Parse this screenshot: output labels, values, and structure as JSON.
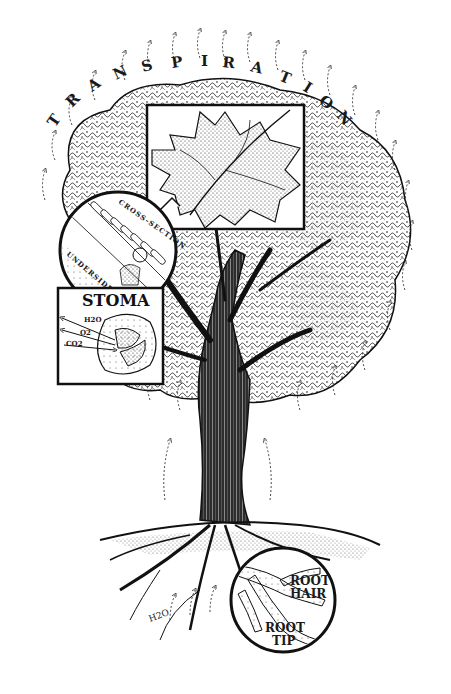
{
  "title_letters": [
    "T",
    "R",
    "A",
    "N",
    "S",
    "P",
    "I",
    "R",
    "A",
    "T",
    "I",
    "O",
    "N"
  ],
  "insets": {
    "leaf": {
      "label": ""
    },
    "cross_section": {
      "label_top": "CROSS-SECTION",
      "label_side": "UNDERSIDE OF LEAF"
    },
    "stoma": {
      "title": "STOMA",
      "arrows": [
        "H2O",
        "O2",
        "CO2"
      ]
    },
    "roots": {
      "label_hair": "ROOT HAIR",
      "label_hair_line1": "ROOT",
      "label_hair_line2": "HAIR",
      "label_tip_line1": "ROOT",
      "label_tip_line2": "TIP"
    }
  },
  "ground_label": "H2O",
  "colors": {
    "ink": "#1a1a1a",
    "paper": "#ffffff",
    "shade": "#7a7a7a"
  }
}
